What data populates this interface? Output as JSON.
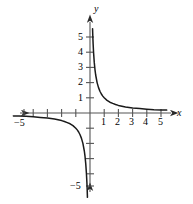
{
  "chart_data": {
    "type": "line",
    "title": "",
    "subtitle": "",
    "xlabel": "x",
    "ylabel": "y",
    "xlim": [
      -5.8,
      5.8
    ],
    "ylim": [
      -5.8,
      5.8
    ],
    "grid": false,
    "legend": null,
    "function": "y = 1/x",
    "xticks": [
      -5,
      -4,
      -3,
      -2,
      -1,
      1,
      2,
      3,
      4,
      5
    ],
    "yticks": [
      -5,
      -4,
      -3,
      -2,
      -1,
      1,
      2,
      3,
      4,
      5
    ],
    "xtick_labels_visible": [
      "-5",
      "1",
      "2",
      "3",
      "4",
      "5"
    ],
    "ytick_labels_visible": [
      "5",
      "4",
      "3",
      "2",
      "1",
      "-5"
    ],
    "series": [
      {
        "name": "branch-quadrant-1",
        "x": [
          0.18,
          0.2,
          0.22,
          0.25,
          0.3,
          0.35,
          0.4,
          0.5,
          0.6,
          0.7,
          0.8,
          0.9,
          1.0,
          1.2,
          1.4,
          1.6,
          1.8,
          2.0,
          2.5,
          3.0,
          3.5,
          4.0,
          4.5,
          5.0,
          5.4
        ],
        "y": [
          5.55,
          5.0,
          4.55,
          4.0,
          3.33,
          2.86,
          2.5,
          2.0,
          1.67,
          1.43,
          1.25,
          1.11,
          1.0,
          0.83,
          0.71,
          0.63,
          0.56,
          0.5,
          0.4,
          0.33,
          0.29,
          0.25,
          0.22,
          0.2,
          0.19
        ]
      },
      {
        "name": "branch-quadrant-3",
        "x": [
          -5.4,
          -5.0,
          -4.5,
          -4.0,
          -3.5,
          -3.0,
          -2.5,
          -2.0,
          -1.8,
          -1.6,
          -1.4,
          -1.2,
          -1.0,
          -0.9,
          -0.8,
          -0.7,
          -0.6,
          -0.5,
          -0.4,
          -0.35,
          -0.3,
          -0.25,
          -0.22,
          -0.2,
          -0.18
        ],
        "y": [
          -0.19,
          -0.2,
          -0.22,
          -0.25,
          -0.29,
          -0.33,
          -0.4,
          -0.5,
          -0.56,
          -0.63,
          -0.71,
          -0.83,
          -1.0,
          -1.11,
          -1.25,
          -1.43,
          -1.67,
          -2.0,
          -2.5,
          -2.86,
          -3.33,
          -4.0,
          -4.55,
          -5.0,
          -5.55
        ]
      }
    ]
  },
  "axis_labels": {
    "x": "x",
    "y": "y"
  },
  "tick_labels": {
    "x_positive": [
      "1",
      "2",
      "3",
      "4",
      "5"
    ],
    "x_negative": [
      "−5"
    ],
    "y_positive": [
      "1",
      "2",
      "3",
      "4",
      "5"
    ],
    "y_negative": [
      "−5"
    ]
  },
  "colors": {
    "curve": "#1a1a1a",
    "axis": "#4a4a4a",
    "text": "#000000",
    "background": "#ffffff"
  }
}
